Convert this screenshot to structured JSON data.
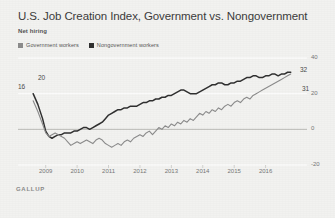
{
  "title": "U.S. Job Creation Index, Government vs. Nongovernment",
  "subtitle": "Net hiring",
  "source": "GALLUP",
  "legend": [
    {
      "label": "Government workers",
      "color": "#8c8c8c",
      "icon": "legend-swatch-icon"
    },
    {
      "label": "Nongovernment workers",
      "color": "#303030",
      "icon": "legend-swatch-icon"
    }
  ],
  "endpoint_labels": {
    "gov_start": "16",
    "nongov_start": "20",
    "nongov_end": "32",
    "gov_end": "31"
  },
  "chart_data": {
    "type": "line",
    "title": "U.S. Job Creation Index, Government vs. Nongovernment",
    "subtitle": "Net hiring",
    "xlabel": "",
    "ylabel": "",
    "ylim": [
      -20,
      40
    ],
    "xlim": [
      2008.5,
      2017.0
    ],
    "grid": true,
    "legend_position": "top-left",
    "yticks": [
      40,
      20,
      0,
      -20
    ],
    "ytick_labels": [
      "40",
      "20",
      "0",
      "-20"
    ],
    "xticks": [
      2009,
      2010,
      2011,
      2012,
      2013,
      2014,
      2015,
      2016
    ],
    "xtick_labels": [
      "2009",
      "2010",
      "2011",
      "2012",
      "2013",
      "2014",
      "2015",
      "2016"
    ],
    "series": [
      {
        "name": "Nongovernment workers",
        "color": "#303030",
        "start_value": 20,
        "end_value": 32,
        "x": [
          2008.6,
          2008.75,
          2008.9,
          2009.0,
          2009.1,
          2009.2,
          2009.3,
          2009.4,
          2009.5,
          2009.6,
          2009.7,
          2009.8,
          2009.9,
          2010.0,
          2010.1,
          2010.2,
          2010.3,
          2010.4,
          2010.5,
          2010.6,
          2010.7,
          2010.8,
          2010.9,
          2011.0,
          2011.1,
          2011.2,
          2011.3,
          2011.4,
          2011.5,
          2011.6,
          2011.7,
          2011.8,
          2011.9,
          2012.0,
          2012.1,
          2012.2,
          2012.3,
          2012.4,
          2012.5,
          2012.6,
          2012.7,
          2012.8,
          2012.9,
          2013.0,
          2013.1,
          2013.2,
          2013.3,
          2013.4,
          2013.5,
          2013.6,
          2013.7,
          2013.8,
          2013.9,
          2014.0,
          2014.1,
          2014.2,
          2014.3,
          2014.4,
          2014.5,
          2014.6,
          2014.7,
          2014.8,
          2014.9,
          2015.0,
          2015.1,
          2015.2,
          2015.3,
          2015.4,
          2015.5,
          2015.6,
          2015.7,
          2015.8,
          2015.9,
          2016.0,
          2016.1,
          2016.2,
          2016.3,
          2016.4,
          2016.5,
          2016.6,
          2016.7,
          2016.8
        ],
        "values": [
          20,
          14,
          6,
          -1,
          -4,
          -5,
          -4,
          -3,
          -3,
          -2,
          -2,
          -2,
          -1,
          -1,
          0,
          1,
          1,
          0,
          1,
          2,
          3,
          4,
          6,
          8,
          9,
          10,
          11,
          11,
          12,
          12,
          13,
          13,
          13,
          14,
          15,
          15,
          16,
          16,
          17,
          17,
          18,
          18,
          19,
          19,
          20,
          21,
          22,
          22,
          21,
          20,
          20,
          20,
          21,
          22,
          23,
          24,
          25,
          25,
          26,
          26,
          25,
          25,
          26,
          26,
          27,
          27,
          28,
          29,
          29,
          30,
          30,
          29,
          29,
          30,
          30,
          31,
          31,
          30,
          31,
          31,
          32,
          32
        ]
      },
      {
        "name": "Government workers",
        "color": "#8c8c8c",
        "start_value": 16,
        "end_value": 31,
        "x": [
          2008.6,
          2008.75,
          2008.9,
          2009.0,
          2009.1,
          2009.2,
          2009.3,
          2009.4,
          2009.5,
          2009.6,
          2009.7,
          2009.8,
          2009.9,
          2010.0,
          2010.1,
          2010.2,
          2010.3,
          2010.4,
          2010.5,
          2010.6,
          2010.7,
          2010.8,
          2010.9,
          2011.0,
          2011.1,
          2011.2,
          2011.3,
          2011.4,
          2011.5,
          2011.6,
          2011.7,
          2011.8,
          2011.9,
          2012.0,
          2012.1,
          2012.2,
          2012.3,
          2012.4,
          2012.5,
          2012.6,
          2012.7,
          2012.8,
          2012.9,
          2013.0,
          2013.1,
          2013.2,
          2013.3,
          2013.4,
          2013.5,
          2013.6,
          2013.7,
          2013.8,
          2013.9,
          2014.0,
          2014.1,
          2014.2,
          2014.3,
          2014.4,
          2014.5,
          2014.6,
          2014.7,
          2014.8,
          2014.9,
          2015.0,
          2015.1,
          2015.2,
          2015.3,
          2015.4,
          2015.5,
          2015.6,
          2015.7,
          2015.8,
          2015.9,
          2016.0,
          2016.1,
          2016.2,
          2016.3,
          2016.4,
          2016.5,
          2016.6,
          2016.7,
          2016.8
        ],
        "values": [
          16,
          10,
          3,
          -2,
          -4,
          -3,
          -2,
          -3,
          -4,
          -5,
          -7,
          -9,
          -8,
          -7,
          -8,
          -7,
          -6,
          -7,
          -8,
          -6,
          -5,
          -6,
          -8,
          -9,
          -10,
          -9,
          -8,
          -9,
          -7,
          -6,
          -7,
          -5,
          -4,
          -3,
          -4,
          -2,
          -1,
          -3,
          -1,
          1,
          0,
          2,
          1,
          3,
          2,
          4,
          3,
          5,
          4,
          6,
          5,
          7,
          9,
          8,
          10,
          9,
          11,
          10,
          12,
          11,
          13,
          14,
          13,
          15,
          16,
          15,
          17,
          18,
          17,
          19,
          20,
          21,
          22,
          23,
          24,
          25,
          26,
          27,
          28,
          29,
          30,
          31
        ]
      }
    ]
  }
}
